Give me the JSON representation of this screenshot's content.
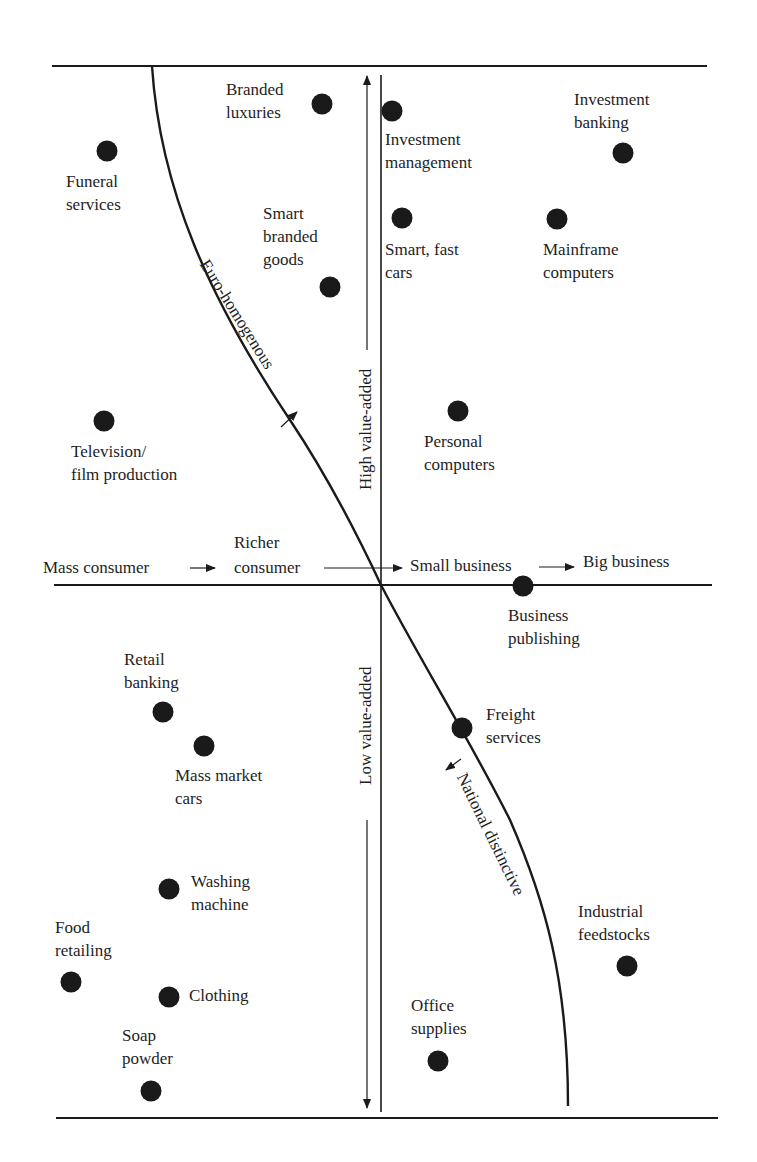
{
  "diagram": {
    "title": "",
    "colors": {
      "ink": "#1a1a1a",
      "background": "#ffffff"
    },
    "frame": {
      "top_line_y": 66,
      "bottom_line_y": 1118,
      "left_x": 54,
      "right_x": 705
    },
    "axes": {
      "horizontal": {
        "y": 585,
        "labels": [
          "Mass consumer",
          "Richer consumer",
          "Small business",
          "Big business"
        ]
      },
      "vertical": {
        "x": 381,
        "up_label": "High value-added",
        "down_label": "Low value-added"
      }
    },
    "curve_labels": {
      "upper": "Euro-homogenous",
      "lower": "National distinctive"
    },
    "items": [
      {
        "id": "branded-luxuries",
        "lines": [
          "Branded",
          "luxuries"
        ],
        "dot": [
          322,
          104
        ],
        "label_pos": [
          226,
          78
        ]
      },
      {
        "id": "investment-management",
        "lines": [
          "Investment",
          "management"
        ],
        "dot": [
          392,
          111
        ],
        "label_pos": [
          385,
          128
        ]
      },
      {
        "id": "investment-banking",
        "lines": [
          "Investment",
          "banking"
        ],
        "dot": [
          623,
          153
        ],
        "label_pos": [
          574,
          88
        ]
      },
      {
        "id": "funeral-services",
        "lines": [
          "Funeral",
          "services"
        ],
        "dot": [
          107,
          151
        ],
        "label_pos": [
          66,
          170
        ]
      },
      {
        "id": "smart-branded-goods",
        "lines": [
          "Smart",
          "branded",
          "goods"
        ],
        "dot": [
          330,
          287
        ],
        "label_pos": [
          263,
          202
        ]
      },
      {
        "id": "smart-fast-cars",
        "lines": [
          "Smart, fast",
          "cars"
        ],
        "dot": [
          402,
          218
        ],
        "label_pos": [
          385,
          238
        ]
      },
      {
        "id": "mainframe-computers",
        "lines": [
          "Mainframe",
          "computers"
        ],
        "dot": [
          557,
          219
        ],
        "label_pos": [
          543,
          238
        ]
      },
      {
        "id": "television-film-production",
        "lines": [
          "Television/",
          "film production"
        ],
        "dot": [
          104,
          421
        ],
        "label_pos": [
          71,
          440
        ]
      },
      {
        "id": "personal-computers",
        "lines": [
          "Personal",
          "computers"
        ],
        "dot": [
          458,
          411
        ],
        "label_pos": [
          424,
          430
        ]
      },
      {
        "id": "business-publishing",
        "lines": [
          "Business",
          "publishing"
        ],
        "dot": [
          523,
          586
        ],
        "label_pos": [
          508,
          604
        ]
      },
      {
        "id": "retail-banking",
        "lines": [
          "Retail",
          "banking"
        ],
        "dot": [
          163,
          712
        ],
        "label_pos": [
          124,
          648
        ]
      },
      {
        "id": "mass-market-cars",
        "lines": [
          "Mass market",
          "cars"
        ],
        "dot": [
          204,
          746
        ],
        "label_pos": [
          175,
          764
        ]
      },
      {
        "id": "freight-services",
        "lines": [
          "Freight",
          "services"
        ],
        "dot": [
          462,
          728
        ],
        "label_pos": [
          486,
          703
        ]
      },
      {
        "id": "washing-machine",
        "lines": [
          "Washing",
          "machine"
        ],
        "dot": [
          169,
          889
        ],
        "label_pos": [
          191,
          870
        ]
      },
      {
        "id": "food-retailing",
        "lines": [
          "Food",
          "retailing"
        ],
        "dot": [
          71,
          982
        ],
        "label_pos": [
          55,
          916
        ]
      },
      {
        "id": "clothing",
        "lines": [
          "Clothing"
        ],
        "dot": [
          169,
          997
        ],
        "label_pos": [
          189,
          984
        ]
      },
      {
        "id": "soap-powder",
        "lines": [
          "Soap",
          "powder"
        ],
        "dot": [
          151,
          1091
        ],
        "label_pos": [
          122,
          1024
        ]
      },
      {
        "id": "industrial-feedstocks",
        "lines": [
          "Industrial",
          "feedstocks"
        ],
        "dot": [
          627,
          966
        ],
        "label_pos": [
          578,
          900
        ]
      },
      {
        "id": "office-supplies",
        "lines": [
          "Office",
          "supplies"
        ],
        "dot": [
          438,
          1061
        ],
        "label_pos": [
          411,
          994
        ]
      }
    ]
  },
  "chart_data": {
    "type": "scatter",
    "title": "",
    "xlabel": "Mass consumer → Richer consumer → Small business → Big business",
    "ylabel": "Low value-added ↔ High value-added",
    "grid": false,
    "boundary_curve": {
      "upper_label": "Euro-homogenous",
      "lower_label": "National distinctive"
    },
    "points": [
      {
        "label": "Branded luxuries",
        "x": 322,
        "y": 104
      },
      {
        "label": "Investment management",
        "x": 392,
        "y": 111
      },
      {
        "label": "Investment banking",
        "x": 623,
        "y": 153
      },
      {
        "label": "Funeral services",
        "x": 107,
        "y": 151
      },
      {
        "label": "Smart branded goods",
        "x": 330,
        "y": 287
      },
      {
        "label": "Smart, fast cars",
        "x": 402,
        "y": 218
      },
      {
        "label": "Mainframe computers",
        "x": 557,
        "y": 219
      },
      {
        "label": "Television/film production",
        "x": 104,
        "y": 421
      },
      {
        "label": "Personal computers",
        "x": 458,
        "y": 411
      },
      {
        "label": "Business publishing",
        "x": 523,
        "y": 586
      },
      {
        "label": "Retail banking",
        "x": 163,
        "y": 712
      },
      {
        "label": "Mass market cars",
        "x": 204,
        "y": 746
      },
      {
        "label": "Freight services",
        "x": 462,
        "y": 728
      },
      {
        "label": "Washing machine",
        "x": 169,
        "y": 889
      },
      {
        "label": "Food retailing",
        "x": 71,
        "y": 982
      },
      {
        "label": "Clothing",
        "x": 169,
        "y": 997
      },
      {
        "label": "Soap powder",
        "x": 151,
        "y": 1091
      },
      {
        "label": "Industrial feedstocks",
        "x": 627,
        "y": 966
      },
      {
        "label": "Office supplies",
        "x": 438,
        "y": 1061
      }
    ]
  }
}
